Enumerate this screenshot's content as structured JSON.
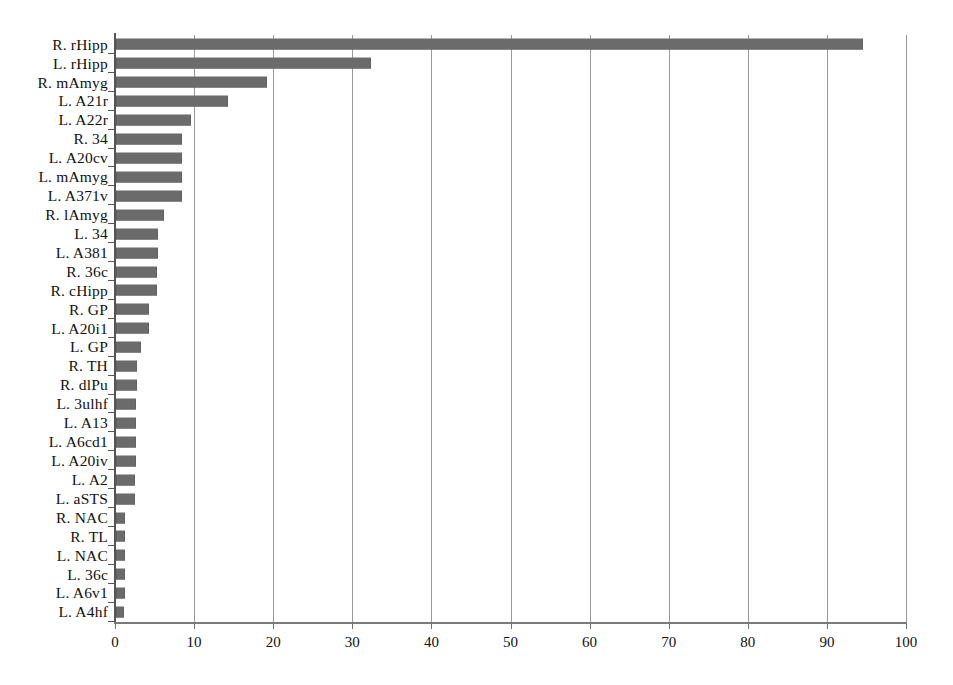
{
  "chart_data": {
    "type": "bar",
    "orientation": "horizontal",
    "title": "",
    "subtitle": "",
    "xlabel": "",
    "ylabel": "",
    "xlim": [
      0,
      100
    ],
    "ylim": null,
    "grid": true,
    "gridlines": "vertical",
    "legend": null,
    "legend_position": "none",
    "bar_color": "#6b6b6b",
    "axis_color": "#555555",
    "gridline_color": "#9a9a9a",
    "xticks": [
      0,
      10,
      20,
      30,
      40,
      50,
      60,
      70,
      80,
      90,
      100
    ],
    "xtick_labels": [
      "0",
      "10",
      "20",
      "30",
      "40",
      "50",
      "60",
      "70",
      "80",
      "90",
      "100"
    ],
    "categories": [
      "R. rHipp",
      "L. rHipp",
      "R. mAmyg",
      "L. A21r",
      "L. A22r",
      "R. 34",
      "L. A20cv",
      "L. mAmyg",
      "L. A371v",
      "R. lAmyg",
      "L. 34",
      "L. A381",
      "R. 36c",
      "R. cHipp",
      "R. GP",
      "L. A20i1",
      "L. GP",
      "R. TH",
      "R. dlPu",
      "L. 3ulhf",
      "L. A13",
      "L. A6cd1",
      "L. A20iv",
      "L. A2",
      "L. aSTS",
      "R. NAC",
      "R. TL",
      "L. NAC",
      "L. 36c",
      "L. A6v1",
      "L. A4hf"
    ],
    "values": [
      94.5,
      32.3,
      19.1,
      14.2,
      9.5,
      8.4,
      8.3,
      8.3,
      8.3,
      6.1,
      5.3,
      5.3,
      5.2,
      5.2,
      4.2,
      4.2,
      3.2,
      2.6,
      2.6,
      2.5,
      2.5,
      2.5,
      2.5,
      2.4,
      2.4,
      1.2,
      1.2,
      1.1,
      1.1,
      1.1,
      1.0
    ]
  }
}
